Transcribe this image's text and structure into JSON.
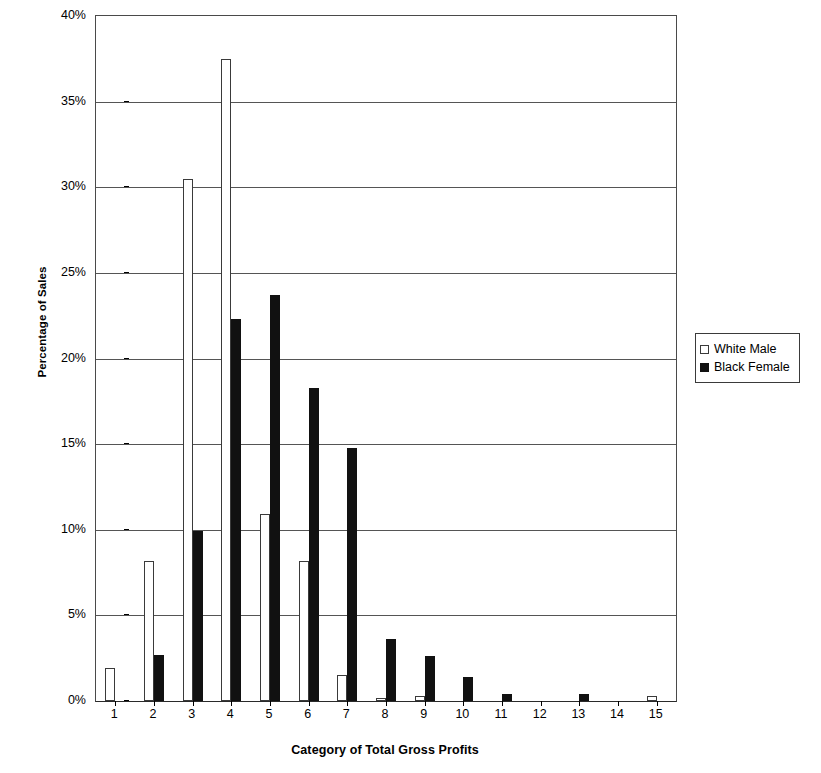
{
  "chart_data": {
    "type": "bar",
    "title": "",
    "xlabel": "Category of Total Gross Profits",
    "ylabel": "Percentage of Sales",
    "categories": [
      "1",
      "2",
      "3",
      "4",
      "5",
      "6",
      "7",
      "8",
      "9",
      "10",
      "11",
      "12",
      "13",
      "14",
      "15"
    ],
    "ylim": [
      0,
      40
    ],
    "y_ticks": [
      0,
      5,
      10,
      15,
      20,
      25,
      30,
      35,
      40
    ],
    "y_tick_labels": [
      "0%",
      "5%",
      "10%",
      "15%",
      "20%",
      "25%",
      "30%",
      "35%",
      "40%"
    ],
    "grid": "horizontal",
    "legend_position": "right",
    "series": [
      {
        "name": "White Male",
        "fill": "#ffffff",
        "edge": "#3a3a3a",
        "values": [
          1.9,
          8.2,
          30.5,
          37.5,
          10.9,
          8.2,
          1.5,
          0.2,
          0.3,
          0.0,
          0.0,
          0.0,
          0.0,
          0.0,
          0.3
        ]
      },
      {
        "name": "Black Female",
        "fill": "#111111",
        "edge": "#111111",
        "values": [
          0.0,
          2.7,
          9.9,
          22.3,
          23.7,
          18.3,
          14.8,
          3.6,
          2.6,
          1.4,
          0.4,
          0.0,
          0.4,
          0.0,
          0.0
        ]
      }
    ]
  },
  "legend": {
    "items": [
      {
        "label": "White Male",
        "swatch": "white-square-icon"
      },
      {
        "label": "Black Female",
        "swatch": "black-square-icon"
      }
    ]
  },
  "axes": {
    "y_title": "Percentage of Sales",
    "x_title": "Category of Total Gross Profits"
  }
}
